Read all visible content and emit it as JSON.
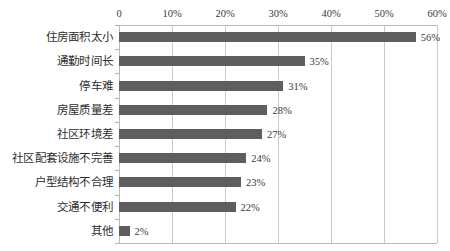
{
  "chart_data": {
    "type": "bar",
    "orientation": "horizontal",
    "title": "",
    "subtitle": "",
    "xlabel": "",
    "ylabel": "",
    "xlim": [
      0,
      60
    ],
    "ylim": null,
    "grid": true,
    "legend": null,
    "legend_position": "none",
    "x_tick_labels": [
      "0",
      "10%",
      "20%",
      "30%",
      "40%",
      "50%",
      "60%"
    ],
    "x_tick_values": [
      0,
      10,
      20,
      30,
      40,
      50,
      60
    ],
    "categories": [
      "住房面积太小",
      "通勤时间长",
      "停车难",
      "房屋质量差",
      "社区环境差",
      "社区配套设施不完善",
      "户型结构不合理",
      "交通不便利",
      "其他"
    ],
    "values": [
      56,
      35,
      31,
      28,
      27,
      24,
      23,
      22,
      2
    ],
    "data_labels": [
      "56%",
      "35%",
      "31%",
      "28%",
      "27%",
      "24%",
      "23%",
      "22%",
      "2%"
    ],
    "series": [
      {
        "name": "",
        "values": [
          56,
          35,
          31,
          28,
          27,
          24,
          23,
          22,
          2
        ]
      }
    ],
    "colors": {
      "bar": "#5e5e5e",
      "gridline": "#c9c9c9",
      "axis": "#b9b9b9",
      "text": "#3a3a3a",
      "background": "#ffffff"
    }
  }
}
